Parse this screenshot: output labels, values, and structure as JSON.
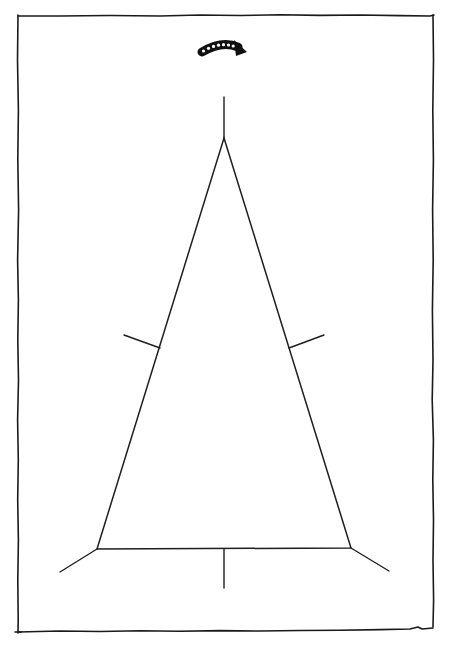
{
  "diagram": {
    "title": "",
    "shape": "triangle",
    "vertices": [
      "apex",
      "bottom-left",
      "bottom-right"
    ],
    "edge_midpoint_ticks": [
      "left-edge",
      "right-edge",
      "base"
    ],
    "vertex_ticks": [
      "apex",
      "bottom-left",
      "bottom-right"
    ],
    "rotation_indicator": {
      "icon": "curved-arrow-icon",
      "direction": "clockwise",
      "dot_count": 7
    },
    "colors": {
      "background": "#ffffff",
      "ink": "#1e1e1e",
      "arrow": "#111111"
    }
  }
}
